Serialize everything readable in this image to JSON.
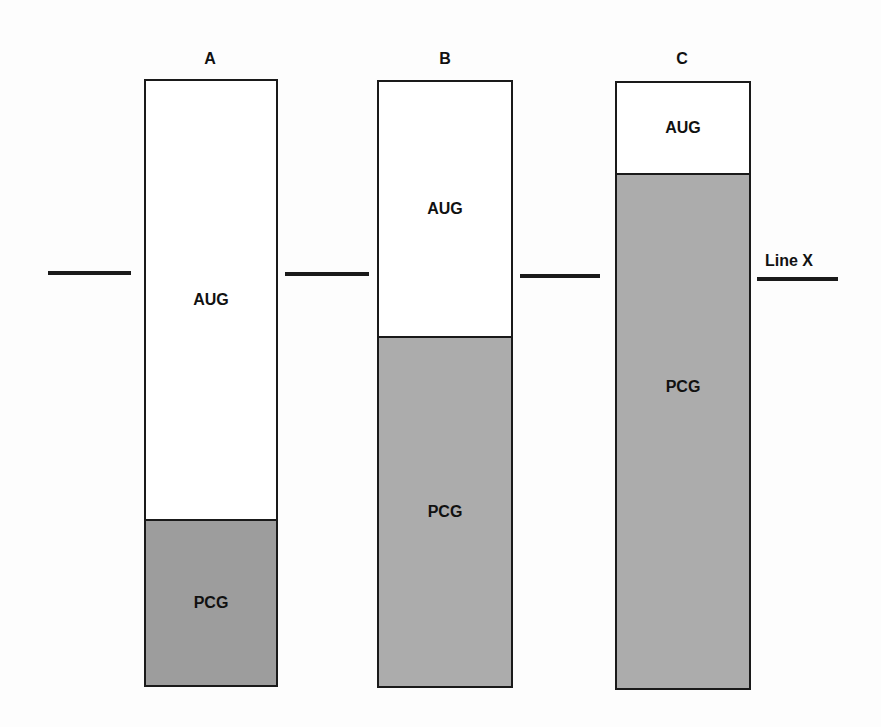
{
  "columns": [
    {
      "label": "A",
      "aug_label": "AUG",
      "pcg_label": "PCG",
      "pcg_color": "#9d9d9d"
    },
    {
      "label": "B",
      "aug_label": "AUG",
      "pcg_label": "PCG",
      "pcg_color": "#acacac"
    },
    {
      "label": "C",
      "aug_label": "AUG",
      "pcg_label": "PCG",
      "pcg_color": "#acacac"
    }
  ],
  "line_x": {
    "label": "Line X"
  }
}
